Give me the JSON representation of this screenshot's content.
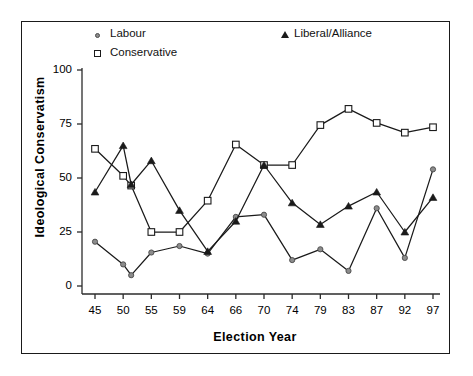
{
  "chart_data": {
    "type": "line",
    "title": "",
    "xlabel": "Election Year",
    "ylabel": "Ideological Conservatism",
    "categories": [
      "45",
      "50",
      "51",
      "55",
      "59",
      "64",
      "66",
      "70",
      "74",
      "79",
      "83",
      "87",
      "92",
      "97"
    ],
    "xtick_labels": [
      "45",
      "50",
      "55",
      "59",
      "64",
      "66",
      "70",
      "74",
      "79",
      "83",
      "87",
      "92",
      "97"
    ],
    "ytick_labels": [
      "0",
      "25",
      "50",
      "75",
      "100"
    ],
    "ylim": [
      0,
      100
    ],
    "yticks": [
      0,
      25,
      50,
      75,
      100
    ],
    "grid": false,
    "legend_position": "top",
    "series": [
      {
        "name": "Labour",
        "marker": "circle",
        "color": "#8c8c8c",
        "values": [
          20.5,
          10.0,
          5.0,
          15.5,
          18.5,
          15.0,
          32.0,
          33.0,
          12.0,
          17.0,
          7.0,
          36.0,
          13.0,
          54.0
        ]
      },
      {
        "name": "Conservative",
        "marker": "square",
        "color": "#ffffff",
        "values": [
          63.5,
          51.0,
          46.5,
          25.0,
          25.0,
          39.5,
          65.5,
          56.0,
          56.0,
          74.5,
          82.0,
          75.5,
          71.0,
          73.5
        ]
      },
      {
        "name": "Liberal/Alliance",
        "marker": "triangle",
        "color": "#1a1a1a",
        "values": [
          43.5,
          65.0,
          47.0,
          58.0,
          35.0,
          16.0,
          30.0,
          56.0,
          38.5,
          28.5,
          37.0,
          43.5,
          25.0,
          41.0
        ]
      }
    ]
  },
  "legend": {
    "items": [
      {
        "label": "Labour",
        "marker": "circle"
      },
      {
        "label": "Conservative",
        "marker": "square"
      },
      {
        "label": "Liberal/Alliance",
        "marker": "triangle"
      }
    ]
  },
  "axes": {
    "x_title": "Election Year",
    "y_title": "Ideological Conservatism"
  }
}
